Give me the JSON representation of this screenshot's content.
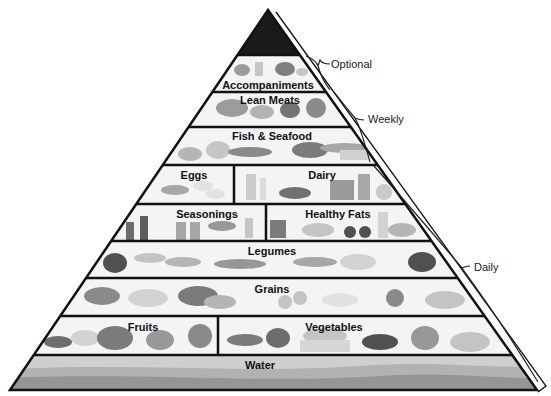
{
  "colors": {
    "tip": "#1a1a1a",
    "outline": "#111111",
    "band_bg": "#f4f4f4",
    "water_light": "#c8c8c8",
    "water_mid": "#a8a8a8",
    "water_dark": "#8a8a8a",
    "food_light": "#b5b5b5",
    "food_dark": "#6a6a6a"
  },
  "tiers": [
    {
      "id": "tip",
      "labels": []
    },
    {
      "id": "accompaniments",
      "labels": [
        "Accompaniments"
      ],
      "frequency": "Optional"
    },
    {
      "id": "lean-meats",
      "labels": [
        "Lean Meats"
      ],
      "frequency": "Weekly"
    },
    {
      "id": "fish-seafood",
      "labels": [
        "Fish & Seafood"
      ],
      "frequency": "Weekly"
    },
    {
      "id": "eggs-dairy",
      "labels": [
        "Eggs",
        "Dairy"
      ],
      "frequency": "Daily"
    },
    {
      "id": "seasonings-fats",
      "labels": [
        "Seasonings",
        "Healthy Fats"
      ],
      "frequency": "Daily"
    },
    {
      "id": "legumes",
      "labels": [
        "Legumes"
      ],
      "frequency": "Daily"
    },
    {
      "id": "grains",
      "labels": [
        "Grains"
      ],
      "frequency": "Daily"
    },
    {
      "id": "fruits-vegetables",
      "labels": [
        "Fruits",
        "Vegetables"
      ],
      "frequency": "Daily"
    },
    {
      "id": "water",
      "labels": [
        "Water"
      ],
      "frequency": "Daily"
    }
  ],
  "labels": {
    "accompaniments": "Accompaniments",
    "lean_meats": "Lean Meats",
    "fish_seafood": "Fish & Seafood",
    "eggs": "Eggs",
    "dairy": "Dairy",
    "seasonings": "Seasonings",
    "healthy_fats": "Healthy Fats",
    "legumes": "Legumes",
    "grains": "Grains",
    "fruits": "Fruits",
    "vegetables": "Vegetables",
    "water": "Water"
  },
  "frequency_brackets": {
    "optional": "Optional",
    "weekly": "Weekly",
    "daily": "Daily"
  }
}
